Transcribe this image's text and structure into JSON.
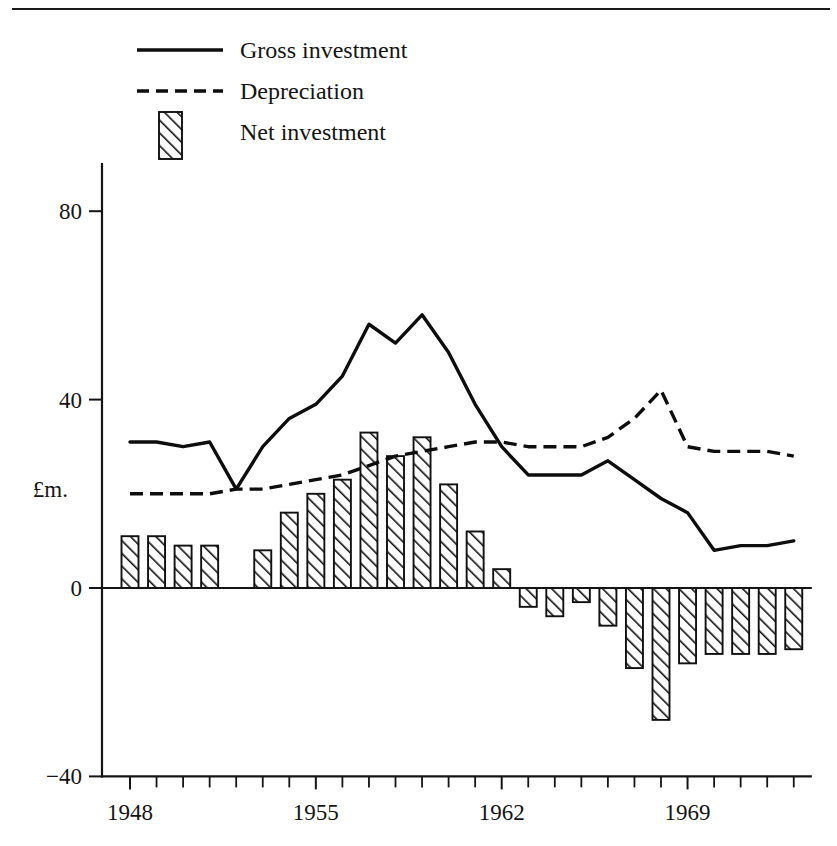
{
  "figure": {
    "currency_label": "£m.",
    "has_top_rule": true,
    "line_color": "#0d0d0d",
    "background": "#ffffff"
  },
  "legend": {
    "position": "top-left",
    "entries": [
      {
        "label": "Gross investment",
        "marker": "solid-line"
      },
      {
        "label": "Depreciation",
        "marker": "dashed-line"
      },
      {
        "label": "Net investment",
        "marker": "hatched-bar"
      }
    ]
  },
  "chart_data": {
    "type": "line",
    "title": "",
    "subtitle": "",
    "xlabel": "",
    "ylabel": "£m.",
    "grid": false,
    "legend_position": "top-left",
    "xlim": [
      1948,
      1973
    ],
    "ylim": [
      -40,
      90
    ],
    "yticks": [
      -40,
      0,
      40,
      80
    ],
    "ytick_labels": [
      "−40",
      "0",
      "40",
      "80"
    ],
    "xticks": [
      1948,
      1955,
      1962,
      1969
    ],
    "xtick_labels": [
      "1948",
      "1955",
      "1962",
      "1969"
    ],
    "x": [
      1948,
      1949,
      1950,
      1951,
      1952,
      1953,
      1954,
      1955,
      1956,
      1957,
      1958,
      1959,
      1960,
      1961,
      1962,
      1963,
      1964,
      1965,
      1966,
      1967,
      1968,
      1969,
      1970,
      1971,
      1972,
      1973
    ],
    "series": [
      {
        "name": "Gross investment",
        "style": "solid",
        "values": [
          31,
          31,
          30,
          31,
          21,
          30,
          36,
          39,
          45,
          56,
          52,
          58,
          50,
          39,
          30,
          24,
          24,
          24,
          27,
          23,
          19,
          16,
          8,
          9,
          9,
          10
        ]
      },
      {
        "name": "Depreciation",
        "style": "dashed",
        "values": [
          20,
          20,
          20,
          20,
          21,
          21,
          22,
          23,
          24,
          26,
          28,
          29,
          30,
          31,
          31,
          30,
          30,
          30,
          32,
          36,
          42,
          30,
          29,
          29,
          29,
          28
        ]
      },
      {
        "name": "Net investment",
        "style": "hatched-bars",
        "values": [
          11,
          11,
          9,
          9,
          0,
          8,
          16,
          20,
          23,
          33,
          28,
          32,
          22,
          12,
          4,
          -4,
          -6,
          -3,
          -8,
          -17,
          -28,
          -16,
          -14,
          -14,
          -14,
          -13
        ]
      }
    ]
  }
}
